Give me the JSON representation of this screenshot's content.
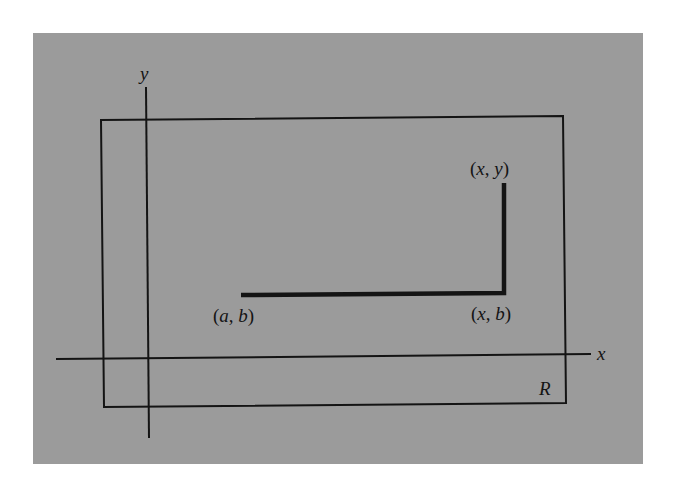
{
  "figure": {
    "axes": {
      "x_label": "x",
      "y_label": "y"
    },
    "region": {
      "label": "R"
    },
    "points": {
      "start": {
        "label": "(a, b)",
        "open": "(",
        "a": "a",
        "sep": ", ",
        "b": "b",
        "close": ")"
      },
      "corner": {
        "label": "(x, b)",
        "open": "(",
        "a": "x",
        "sep": ", ",
        "b": "b",
        "close": ")"
      },
      "end": {
        "label": "(x, y)",
        "open": "(",
        "a": "x",
        "sep": ", ",
        "b": "y",
        "close": ")"
      }
    },
    "colors": {
      "background": "#9b9b9b",
      "ink": "#141414",
      "page": "#ffffff"
    }
  }
}
